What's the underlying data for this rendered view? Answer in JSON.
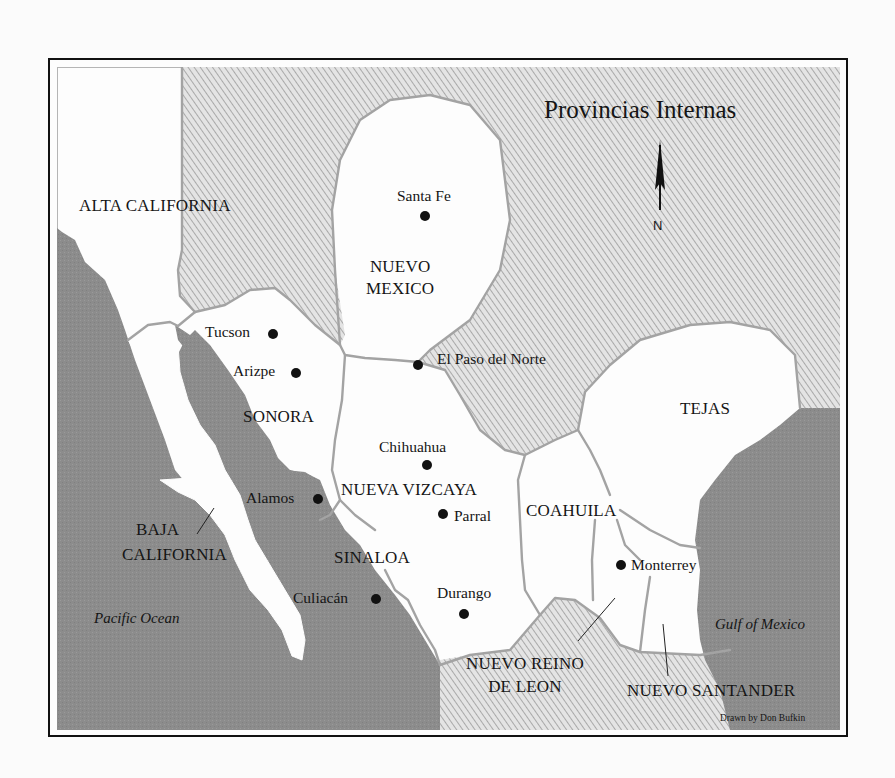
{
  "map": {
    "title": "Provincias Internas",
    "north_label": "N",
    "credit": "Drawn by Don Bufkin",
    "colors": {
      "frame": "#111111",
      "ocean": "#8c8c8c",
      "hatch_bg": "#e6e6e6",
      "hatch_line": "#9a9a9a",
      "land": "#fdfdfd",
      "border": "#a3a3a3",
      "text": "#151515"
    },
    "regions": [
      {
        "name": "ALTA CALIFORNIA"
      },
      {
        "name": "NUEVO MEXICO",
        "line1": "NUEVO",
        "line2": "MEXICO"
      },
      {
        "name": "SONORA"
      },
      {
        "name": "NUEVA VIZCAYA"
      },
      {
        "name": "TEJAS"
      },
      {
        "name": "COAHUILA"
      },
      {
        "name": "SINALOA"
      },
      {
        "name": "BAJA CALIFORNIA",
        "line1": "BAJA",
        "line2": "CALIFORNIA"
      },
      {
        "name": "NUEVO REINO DE LEON",
        "line1": "NUEVO REINO",
        "line2": "DE LEON"
      },
      {
        "name": "NUEVO SANTANDER"
      }
    ],
    "cities": [
      {
        "name": "Santa Fe"
      },
      {
        "name": "Tucson"
      },
      {
        "name": "Arizpe"
      },
      {
        "name": "El Paso del Norte"
      },
      {
        "name": "Chihuahua"
      },
      {
        "name": "Alamos"
      },
      {
        "name": "Parral"
      },
      {
        "name": "Culiacán"
      },
      {
        "name": "Durango"
      },
      {
        "name": "Monterrey"
      }
    ],
    "water_bodies": [
      {
        "name": "Pacific Ocean"
      },
      {
        "name": "Gulf of Mexico"
      }
    ]
  }
}
